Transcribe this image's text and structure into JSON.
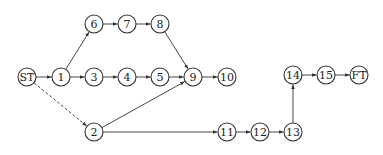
{
  "diagram": {
    "type": "network-precedence-diagram",
    "colors": {
      "stroke": "#333333",
      "fill": "#ffffff",
      "text": "#222222"
    },
    "nodes": [
      {
        "id": "ST",
        "label": "ST",
        "x": 27,
        "y": 77
      },
      {
        "id": "1",
        "label": "1",
        "x": 61,
        "y": 77
      },
      {
        "id": "2",
        "label": "2",
        "x": 94,
        "y": 132
      },
      {
        "id": "3",
        "label": "3",
        "x": 94,
        "y": 77
      },
      {
        "id": "4",
        "label": "4",
        "x": 127,
        "y": 77
      },
      {
        "id": "5",
        "label": "5",
        "x": 160,
        "y": 77
      },
      {
        "id": "6",
        "label": "6",
        "x": 94,
        "y": 24
      },
      {
        "id": "7",
        "label": "7",
        "x": 127,
        "y": 24
      },
      {
        "id": "8",
        "label": "8",
        "x": 160,
        "y": 24
      },
      {
        "id": "9",
        "label": "9",
        "x": 193,
        "y": 77
      },
      {
        "id": "10",
        "label": "10",
        "x": 227,
        "y": 77
      },
      {
        "id": "11",
        "label": "11",
        "x": 227,
        "y": 132
      },
      {
        "id": "12",
        "label": "12",
        "x": 260,
        "y": 132
      },
      {
        "id": "13",
        "label": "13",
        "x": 293,
        "y": 132
      },
      {
        "id": "14",
        "label": "14",
        "x": 293,
        "y": 75
      },
      {
        "id": "15",
        "label": "15",
        "x": 326,
        "y": 75
      },
      {
        "id": "FT",
        "label": "FT",
        "x": 359,
        "y": 75
      }
    ],
    "edges": [
      {
        "from": "ST",
        "to": "1",
        "style": "solid"
      },
      {
        "from": "ST",
        "to": "2",
        "style": "dashed"
      },
      {
        "from": "1",
        "to": "6",
        "style": "solid"
      },
      {
        "from": "1",
        "to": "3",
        "style": "solid"
      },
      {
        "from": "6",
        "to": "7",
        "style": "solid"
      },
      {
        "from": "7",
        "to": "8",
        "style": "solid"
      },
      {
        "from": "8",
        "to": "9",
        "style": "solid"
      },
      {
        "from": "3",
        "to": "4",
        "style": "solid"
      },
      {
        "from": "4",
        "to": "5",
        "style": "solid"
      },
      {
        "from": "5",
        "to": "9",
        "style": "solid"
      },
      {
        "from": "9",
        "to": "10",
        "style": "solid"
      },
      {
        "from": "2",
        "to": "9",
        "style": "solid"
      },
      {
        "from": "2",
        "to": "11",
        "style": "solid"
      },
      {
        "from": "11",
        "to": "12",
        "style": "solid"
      },
      {
        "from": "12",
        "to": "13",
        "style": "solid"
      },
      {
        "from": "13",
        "to": "14",
        "style": "solid"
      },
      {
        "from": "14",
        "to": "15",
        "style": "solid"
      },
      {
        "from": "15",
        "to": "FT",
        "style": "solid"
      }
    ],
    "node_radius": 9
  }
}
